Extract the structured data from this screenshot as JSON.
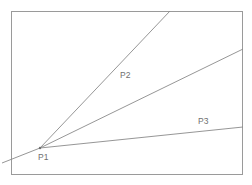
{
  "figure": {
    "background_color": "#ffffff",
    "frame": {
      "x": 11,
      "y": 11,
      "width": 232,
      "height": 164,
      "stroke_color": "#9a9a9a",
      "stroke_width": 1
    },
    "line_color": "#8a8a8a",
    "label_color": "#6f6f6f"
  },
  "chart_data": {
    "type": "line",
    "title": "",
    "xlabel": "",
    "ylabel": "",
    "grid": false,
    "legend": "none",
    "points": [
      {
        "id": "P1",
        "label": "P1",
        "x": 40,
        "y": 148,
        "label_x": 38,
        "label_y": 160,
        "role": "vertex"
      },
      {
        "id": "P2",
        "label": "P2",
        "x": 122,
        "y": 78,
        "label_x": 120,
        "label_y": 78,
        "role": "ray-label"
      },
      {
        "id": "P3",
        "label": "P3",
        "x": 200,
        "y": 124,
        "label_x": 198,
        "label_y": 124,
        "role": "ray-label"
      }
    ],
    "series": [
      {
        "name": "ray-p2",
        "from": "P1",
        "x": [
          40,
          170
        ],
        "y": [
          148,
          11
        ],
        "slope_note": "steepest ray; exits top border"
      },
      {
        "name": "ray-middle",
        "from": "P1",
        "x": [
          40,
          243
        ],
        "y": [
          148,
          49
        ],
        "slope_note": "middle ray; exits right border"
      },
      {
        "name": "ray-p3",
        "from": "P1",
        "x": [
          40,
          243
        ],
        "y": [
          148,
          127
        ],
        "slope_note": "shallowest ray; exits right border"
      },
      {
        "name": "stub-lower-left",
        "from": "P1",
        "x": [
          40,
          2
        ],
        "y": [
          148,
          163
        ],
        "slope_note": "short extension below-left of P1, crosses frame edge"
      }
    ]
  }
}
